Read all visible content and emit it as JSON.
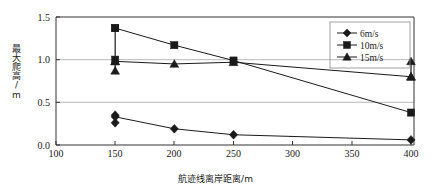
{
  "chart_data": {
    "type": "line",
    "title": "",
    "xlabel": "航迹线离岸距离/m",
    "ylabel": "最大爬高/m",
    "x_ticks": [
      "100",
      "150",
      "200",
      "250",
      "300",
      "350",
      "400"
    ],
    "y_ticks": [
      "0.0",
      "0.5",
      "1.0",
      "1.5"
    ],
    "ylim": [
      0.0,
      1.5
    ],
    "xlim": [
      100,
      400
    ],
    "grid": "horizontal",
    "legend_position": "top-right",
    "x": [
      150,
      200,
      250,
      400
    ],
    "series": [
      {
        "name": "6m/s",
        "marker": "diamond",
        "values": [
          0.33,
          0.19,
          0.12,
          0.06
        ],
        "err_low": [
          0.26,
          null,
          null,
          null
        ],
        "err_high": [
          0.35,
          null,
          null,
          null
        ]
      },
      {
        "name": "10m/s",
        "marker": "square",
        "values": [
          1.37,
          1.17,
          0.99,
          0.38
        ],
        "err_low": [
          1.0,
          null,
          null,
          null
        ],
        "err_high": [
          1.37,
          null,
          null,
          null
        ]
      },
      {
        "name": "15m/s",
        "marker": "triangle",
        "values": [
          0.98,
          0.95,
          0.97,
          0.8
        ],
        "err_low": [
          0.87,
          null,
          null,
          0.8
        ],
        "err_high": [
          0.98,
          null,
          null,
          0.98
        ]
      }
    ],
    "colors": {
      "line": "#1a1a1a",
      "marker": "#1a1a1a",
      "grid": "#b8b8b8",
      "axis": "#333333",
      "background": "#ffffff"
    }
  },
  "legend": {
    "items": [
      {
        "label": "6m/s"
      },
      {
        "label": "10m/s"
      },
      {
        "label": "15m/s"
      }
    ]
  }
}
